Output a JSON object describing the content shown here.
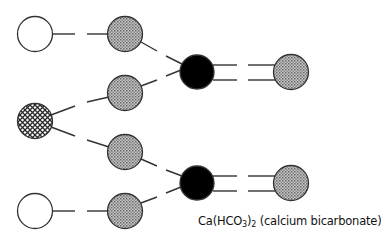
{
  "diagram": {
    "caption": {
      "prefix": "Ca(HCO",
      "sub1": "3",
      "mid": ")",
      "sub2": "2",
      "suffix": " (calcium bicarbonate)"
    },
    "atoms": [
      {
        "id": "left-top",
        "type": "white",
        "cx": 35,
        "cy": 34
      },
      {
        "id": "left-mid",
        "type": "crosshatch",
        "cx": 35,
        "cy": 121
      },
      {
        "id": "left-bottom",
        "type": "white",
        "cx": 35,
        "cy": 211
      },
      {
        "id": "gray-1",
        "type": "gray",
        "cx": 125,
        "cy": 34
      },
      {
        "id": "gray-2",
        "type": "gray",
        "cx": 125,
        "cy": 93
      },
      {
        "id": "gray-3",
        "type": "gray",
        "cx": 125,
        "cy": 152
      },
      {
        "id": "gray-4",
        "type": "gray",
        "cx": 125,
        "cy": 211
      },
      {
        "id": "black-1",
        "type": "black",
        "cx": 197,
        "cy": 72
      },
      {
        "id": "black-2",
        "type": "black",
        "cx": 197,
        "cy": 183
      },
      {
        "id": "right-1",
        "type": "gray",
        "cx": 291,
        "cy": 72
      },
      {
        "id": "right-2",
        "type": "gray",
        "cx": 291,
        "cy": 183
      }
    ],
    "colors": {
      "white_fill": "#ffffff",
      "gray_fill": "#a8a8a8",
      "black_fill": "#000000",
      "stroke": "#333333"
    }
  }
}
